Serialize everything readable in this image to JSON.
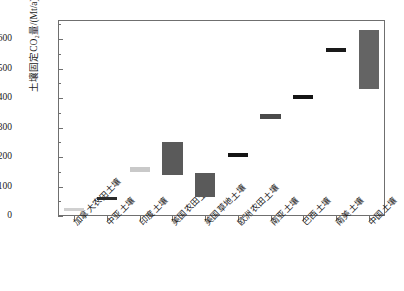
{
  "chart_data": {
    "type": "bar",
    "title": "",
    "xlabel": "",
    "ylabel": "土壤固定CO₂量/(Mt/a)",
    "ylim": [
      0,
      650
    ],
    "grid": false,
    "legend": "none",
    "yticks": [
      0,
      100,
      200,
      300,
      400,
      500,
      600
    ],
    "ytick_labels": [
      "0",
      "100",
      "200",
      "300",
      "400",
      "500",
      "600"
    ],
    "categories": [
      "加拿大农田土壤",
      "中亚土壤",
      "印度土壤",
      "美国农田土壤",
      "美国草地土壤",
      "欧洲农田土壤",
      "南亚土壤",
      "巴西土壤",
      "南美土壤",
      "中国土壤"
    ],
    "series": [
      {
        "name": "土壤固碳潜力范围",
        "low": [
          20,
          55,
          150,
          140,
          65,
          200,
          330,
          395,
          555,
          430
        ],
        "high": [
          28,
          65,
          165,
          250,
          145,
          215,
          345,
          410,
          570,
          630
        ]
      }
    ],
    "bar_colors": [
      "#d0d0d0",
      "#2b2b2b",
      "#c9c9c9",
      "#5a5a5a",
      "#5a5a5a",
      "#141414",
      "#4a4a4a",
      "#141414",
      "#1a1a1a",
      "#646464"
    ],
    "colors": {
      "axis": "#6f6f6f",
      "text": "#1a1a1a",
      "background": "#ffffff"
    }
  }
}
